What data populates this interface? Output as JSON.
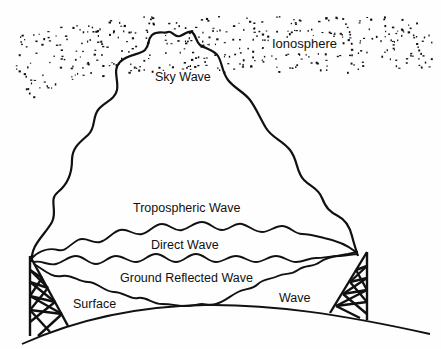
{
  "diagram": {
    "labels": {
      "ionosphere": "Ionosphere",
      "sky_wave": "Sky Wave",
      "tropospheric_wave": "Tropospheric Wave",
      "direct_wave": "Direct Wave",
      "ground_reflected_wave": "Ground Reflected Wave",
      "surface": "Surface",
      "wave": "Wave"
    },
    "colors": {
      "ink": "#111111",
      "background": "#fefefe"
    },
    "elements": [
      {
        "name": "ionosphere",
        "type": "dotted-band"
      },
      {
        "name": "sky-wave",
        "type": "path",
        "from": "transmitter-tower",
        "via": "ionosphere",
        "to": "receiver-tower"
      },
      {
        "name": "tropospheric-wave",
        "type": "path"
      },
      {
        "name": "direct-wave",
        "type": "path"
      },
      {
        "name": "ground-reflected-wave",
        "type": "path"
      },
      {
        "name": "surface-wave",
        "type": "path"
      },
      {
        "name": "earth-surface",
        "type": "arc"
      },
      {
        "name": "transmitter-tower",
        "type": "lattice-tower",
        "side": "left"
      },
      {
        "name": "receiver-tower",
        "type": "lattice-tower",
        "side": "right"
      }
    ]
  }
}
